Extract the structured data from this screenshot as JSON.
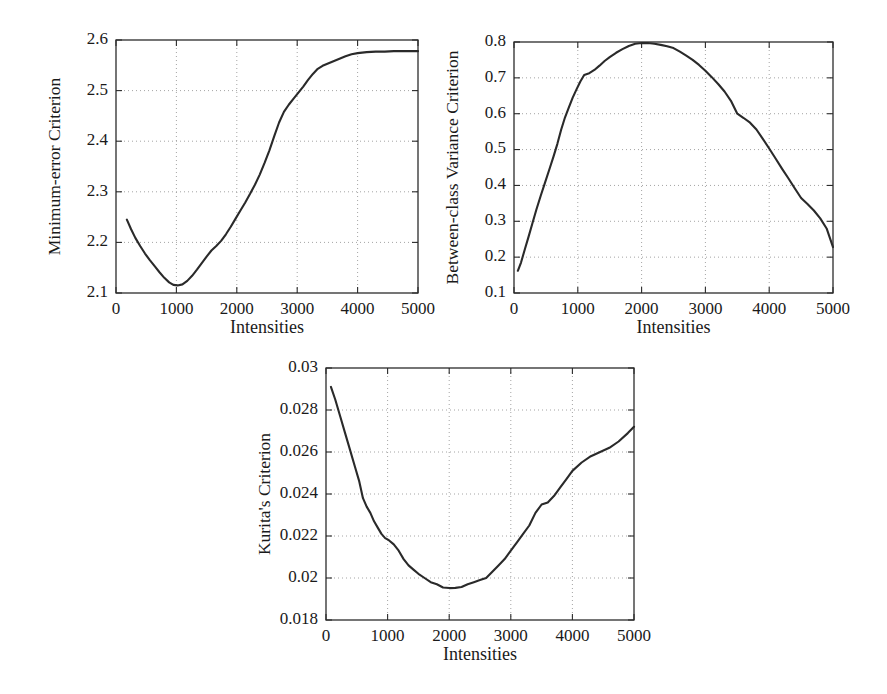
{
  "figure": {
    "background": "#ffffff",
    "curve_color": "#2a2a2a",
    "grid_color": "#9a9a9a",
    "axis_color": "#2b2b2b",
    "panel_count": 3
  },
  "chart_data": [
    {
      "type": "line",
      "title": "",
      "xlabel": "Intensities",
      "ylabel": "Minimum-error Criterion",
      "xlim": [
        0,
        5000
      ],
      "ylim": [
        2.1,
        2.6
      ],
      "xticks": [
        0,
        1000,
        2000,
        3000,
        4000,
        5000
      ],
      "xtick_labels": [
        "0",
        "1000",
        "2000",
        "3000",
        "4000",
        "5000"
      ],
      "yticks": [
        2.1,
        2.2,
        2.3,
        2.4,
        2.5,
        2.6
      ],
      "ytick_labels": [
        "2.1",
        "2.2",
        "2.3",
        "2.4",
        "2.5",
        "2.6"
      ],
      "grid": true,
      "legend": null,
      "x": [
        180,
        250,
        320,
        400,
        480,
        560,
        640,
        720,
        800,
        880,
        950,
        1020,
        1100,
        1180,
        1260,
        1340,
        1420,
        1500,
        1580,
        1660,
        1740,
        1820,
        1900,
        1980,
        2060,
        2140,
        2220,
        2300,
        2380,
        2460,
        2540,
        2620,
        2700,
        2780,
        2860,
        2940,
        3020,
        3100,
        3180,
        3260,
        3340,
        3420,
        3500,
        3600,
        3700,
        3800,
        3900,
        4000,
        4150,
        4300,
        4450,
        4600,
        4750,
        4900,
        5000
      ],
      "y": [
        2.245,
        2.226,
        2.209,
        2.193,
        2.178,
        2.165,
        2.153,
        2.141,
        2.13,
        2.121,
        2.116,
        2.115,
        2.117,
        2.124,
        2.134,
        2.146,
        2.159,
        2.172,
        2.184,
        2.193,
        2.203,
        2.216,
        2.231,
        2.247,
        2.263,
        2.279,
        2.296,
        2.314,
        2.334,
        2.357,
        2.382,
        2.41,
        2.437,
        2.458,
        2.472,
        2.484,
        2.496,
        2.508,
        2.521,
        2.533,
        2.543,
        2.549,
        2.553,
        2.558,
        2.563,
        2.568,
        2.572,
        2.574,
        2.576,
        2.577,
        2.577,
        2.578,
        2.578,
        2.578,
        2.578
      ]
    },
    {
      "type": "line",
      "title": "",
      "xlabel": "Intensities",
      "ylabel": "Between-class Variance Criterion",
      "xlim": [
        0,
        5000
      ],
      "ylim": [
        0.1,
        0.8
      ],
      "xticks": [
        0,
        1000,
        2000,
        3000,
        4000,
        5000
      ],
      "xtick_labels": [
        "0",
        "1000",
        "2000",
        "3000",
        "4000",
        "5000"
      ],
      "yticks": [
        0.1,
        0.2,
        0.3,
        0.4,
        0.5,
        0.6,
        0.7,
        0.8
      ],
      "ytick_labels": [
        "0.1",
        "0.2",
        "0.3",
        "0.4",
        "0.5",
        "0.6",
        "0.7",
        "0.8"
      ],
      "grid": true,
      "legend": null,
      "x": [
        60,
        110,
        170,
        230,
        290,
        350,
        420,
        490,
        560,
        620,
        680,
        740,
        800,
        860,
        920,
        980,
        1040,
        1100,
        1180,
        1260,
        1340,
        1420,
        1500,
        1600,
        1700,
        1800,
        1900,
        2000,
        2100,
        2200,
        2300,
        2400,
        2500,
        2600,
        2700,
        2800,
        2900,
        3000,
        3100,
        3200,
        3300,
        3400,
        3500,
        3600,
        3700,
        3800,
        3900,
        4000,
        4100,
        4200,
        4300,
        4400,
        4500,
        4600,
        4700,
        4800,
        4900,
        5000
      ],
      "y": [
        0.162,
        0.185,
        0.222,
        0.258,
        0.295,
        0.332,
        0.372,
        0.41,
        0.448,
        0.481,
        0.516,
        0.556,
        0.59,
        0.618,
        0.645,
        0.668,
        0.69,
        0.708,
        0.713,
        0.722,
        0.734,
        0.747,
        0.758,
        0.77,
        0.78,
        0.789,
        0.795,
        0.797,
        0.797,
        0.795,
        0.792,
        0.788,
        0.783,
        0.773,
        0.762,
        0.75,
        0.736,
        0.72,
        0.702,
        0.683,
        0.662,
        0.636,
        0.6,
        0.588,
        0.575,
        0.556,
        0.53,
        0.503,
        0.475,
        0.447,
        0.42,
        0.392,
        0.365,
        0.348,
        0.33,
        0.308,
        0.28,
        0.228
      ]
    },
    {
      "type": "line",
      "title": "",
      "xlabel": "Intensities",
      "ylabel": "Kurita's Criterion",
      "xlim": [
        0,
        5000
      ],
      "ylim": [
        0.018,
        0.03
      ],
      "xticks": [
        0,
        1000,
        2000,
        3000,
        4000,
        5000
      ],
      "xtick_labels": [
        "0",
        "1000",
        "2000",
        "3000",
        "4000",
        "5000"
      ],
      "yticks": [
        0.018,
        0.02,
        0.022,
        0.024,
        0.026,
        0.028,
        0.03
      ],
      "ytick_labels": [
        "0.018",
        "0.02",
        "0.022",
        "0.024",
        "0.026",
        "0.028",
        "0.03"
      ],
      "grid": true,
      "legend": null,
      "x": [
        80,
        150,
        230,
        310,
        390,
        470,
        540,
        600,
        660,
        720,
        780,
        840,
        900,
        960,
        1020,
        1100,
        1180,
        1260,
        1340,
        1420,
        1500,
        1600,
        1700,
        1800,
        1900,
        2000,
        2100,
        2200,
        2300,
        2400,
        2500,
        2600,
        2700,
        2800,
        2900,
        3000,
        3100,
        3200,
        3300,
        3400,
        3500,
        3600,
        3700,
        3800,
        3900,
        4000,
        4150,
        4300,
        4450,
        4600,
        4750,
        4900,
        5000
      ],
      "y": [
        0.0291,
        0.0285,
        0.0277,
        0.0269,
        0.0261,
        0.0253,
        0.0246,
        0.0238,
        0.0234,
        0.0231,
        0.0227,
        0.0224,
        0.0221,
        0.0219,
        0.0218,
        0.0216,
        0.0213,
        0.0209,
        0.0206,
        0.0204,
        0.0202,
        0.02,
        0.0198,
        0.0197,
        0.01955,
        0.01952,
        0.01953,
        0.01957,
        0.0197,
        0.0198,
        0.0199,
        0.02,
        0.0203,
        0.0206,
        0.0209,
        0.0213,
        0.0217,
        0.0221,
        0.0225,
        0.0231,
        0.0235,
        0.0236,
        0.0239,
        0.0243,
        0.0247,
        0.0251,
        0.0255,
        0.0258,
        0.026,
        0.0262,
        0.0265,
        0.0269,
        0.0272
      ]
    }
  ],
  "panels": [
    {
      "name": "minimum-error-panel",
      "left": 28,
      "top": 20,
      "width": 420,
      "height": 340,
      "plot_x": 88,
      "plot_y": 20,
      "plot_w": 302,
      "plot_h": 253
    },
    {
      "name": "between-class-variance-panel",
      "left": 440,
      "top": 20,
      "width": 440,
      "height": 340,
      "plot_x": 74,
      "plot_y": 22,
      "plot_w": 319,
      "plot_h": 251
    },
    {
      "name": "kuritas-criterion-panel",
      "left": 236,
      "top": 348,
      "width": 440,
      "height": 340,
      "plot_x": 90,
      "plot_y": 20,
      "plot_w": 308,
      "plot_h": 252
    }
  ]
}
